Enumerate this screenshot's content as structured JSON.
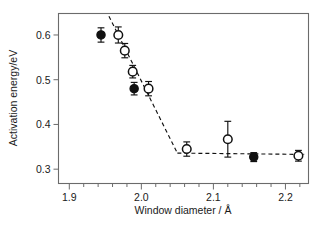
{
  "chart_data": {
    "type": "scatter",
    "title": "",
    "xlabel": "Window diameter / Å",
    "ylabel": "Activation energy/eV",
    "xlim": [
      1.885,
      2.232
    ],
    "ylim": [
      0.268,
      0.648
    ],
    "grid": false,
    "legend": "none",
    "xticks": [
      "1.9",
      "2.0",
      "2.1",
      "2.2"
    ],
    "xtick_values": [
      1.9,
      2.0,
      2.1,
      2.2
    ],
    "xminor_step": 0.02,
    "yticks": [
      "0.3",
      "0.4",
      "0.5",
      "0.6"
    ],
    "ytick_values": [
      0.3,
      0.4,
      0.5,
      0.6
    ],
    "series": [
      {
        "name": "filled-circles",
        "marker": "filled circle",
        "x": [
          1.944,
          1.99,
          2.156
        ],
        "y": [
          0.6,
          0.48,
          0.327
        ],
        "yerr": [
          0.016,
          0.014,
          0.01
        ]
      },
      {
        "name": "open-circles",
        "marker": "open circle",
        "x": [
          1.968,
          1.977,
          1.988,
          2.01,
          2.063,
          2.12,
          2.218
        ],
        "y": [
          0.6,
          0.565,
          0.518,
          0.48,
          0.345,
          0.367,
          0.33
        ],
        "yerr": [
          0.018,
          0.016,
          0.014,
          0.016,
          0.016,
          0.04,
          0.012
        ]
      }
    ],
    "annotations": [
      {
        "name": "descending-dashed-guide",
        "style": "dashed",
        "points": [
          [
            1.955,
            0.642
          ],
          [
            2.05,
            0.336
          ]
        ]
      },
      {
        "name": "plateau-dashed-guide",
        "style": "dashed",
        "points": [
          [
            2.05,
            0.336
          ],
          [
            2.226,
            0.333
          ]
        ]
      }
    ]
  },
  "axes": {
    "x_title": "Window diameter / Å",
    "y_title": "Activation energy/eV",
    "x_tick_labels": [
      "1.9",
      "2.0",
      "2.1",
      "2.2"
    ],
    "y_tick_labels": [
      "0.3",
      "0.4",
      "0.5",
      "0.6"
    ]
  },
  "colors": {
    "frame": "#6b6b6b",
    "marker": "#111111",
    "background": "#ffffff"
  }
}
